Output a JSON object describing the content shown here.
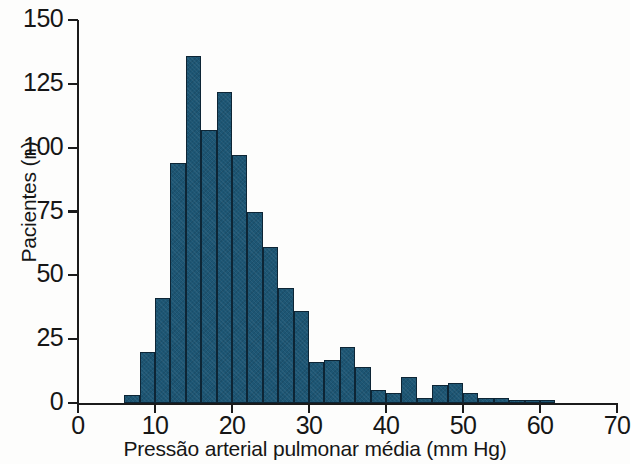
{
  "chart_data": {
    "type": "bar",
    "title": "",
    "subtitle": "",
    "xlabel": "Pressão arterial pulmonar média (mm Hg)",
    "ylabel": "Pacientes (n)",
    "xlim": [
      0,
      70
    ],
    "ylim": [
      0,
      150
    ],
    "xticks": [
      0,
      10,
      20,
      30,
      40,
      50,
      60,
      70
    ],
    "xtick_labels": [
      "0",
      "10",
      "20",
      "30",
      "40",
      "50",
      "60",
      "70"
    ],
    "yticks": [
      0,
      25,
      50,
      75,
      100,
      125,
      150
    ],
    "ytick_labels": [
      "0",
      "25",
      "50",
      "75",
      "100",
      "125",
      "150"
    ],
    "grid": false,
    "legend": null,
    "bin_width": 2,
    "bar_color": "#1d5674",
    "bar_edge_color": "#0d2535",
    "bin_starts": [
      6,
      8,
      10,
      12,
      14,
      16,
      18,
      20,
      22,
      24,
      26,
      28,
      30,
      32,
      34,
      36,
      38,
      40,
      42,
      44,
      46,
      48,
      50,
      52,
      54,
      56,
      58,
      60
    ],
    "categories": [
      "6-8",
      "8-10",
      "10-12",
      "12-14",
      "14-16",
      "16-18",
      "18-20",
      "20-22",
      "22-24",
      "24-26",
      "26-28",
      "28-30",
      "30-32",
      "32-34",
      "34-36",
      "36-38",
      "38-40",
      "40-42",
      "42-44",
      "44-46",
      "46-48",
      "48-50",
      "50-52",
      "52-54",
      "54-56",
      "56-58",
      "58-60",
      "60-62"
    ],
    "values": [
      3,
      20,
      41,
      94,
      136,
      107,
      122,
      97,
      75,
      61,
      45,
      36,
      16,
      17,
      22,
      14,
      5,
      4,
      10,
      2,
      7,
      8,
      4,
      2,
      2,
      1,
      1,
      1
    ]
  }
}
